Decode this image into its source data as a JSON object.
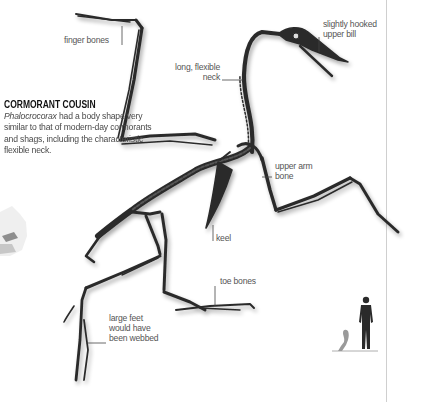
{
  "sidebar": {
    "heading": "CORMORANT COUSIN",
    "genus": "Phalocrocorax",
    "body_rest": " had a body shape very similar to that of modern-day cormorants and shags, including the characteristic flexible neck."
  },
  "labels": {
    "finger_bones": "finger bones",
    "upper_bill_line1": "slightly hooked",
    "upper_bill_line2": "upper bill",
    "neck_line1": "long, flexible",
    "neck_line2": "neck",
    "upper_arm_line1": "upper arm",
    "upper_arm_line2": "bone",
    "keel": "keel",
    "toe_bones": "toe bones",
    "feet_line1": "large feet",
    "feet_line2": "would have",
    "feet_line3": "been webbed"
  },
  "scale_diagram": {
    "figures": [
      "human-silhouette",
      "cormorant-silhouette"
    ]
  },
  "colors": {
    "bone": "#2b2b2b",
    "label_text": "#555555",
    "leader_line": "#444444",
    "divider": "#cfcfcf"
  }
}
